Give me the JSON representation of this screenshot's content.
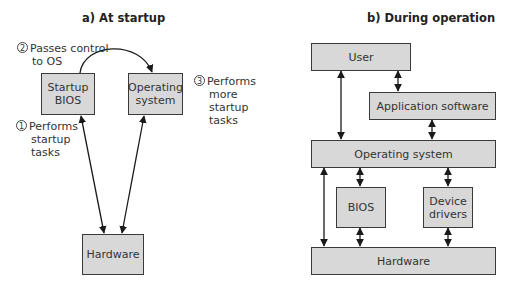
{
  "panel_a": {
    "title": "a) At startup",
    "boxes": {
      "startup_bios": "Startup BIOS",
      "operating_system": "Operating system",
      "hardware": "Hardware"
    },
    "notes": [
      {
        "num": "2",
        "lines": [
          "Passes control",
          "to OS"
        ]
      },
      {
        "num": "3",
        "lines": [
          "Performs",
          "more",
          "startup",
          "tasks"
        ]
      },
      {
        "num": "1",
        "lines": [
          "Performs",
          "startup",
          "tasks"
        ]
      }
    ]
  },
  "panel_b": {
    "title": "b) During operation",
    "boxes": {
      "user": "User",
      "application_software": "Application software",
      "operating_system": "Operating system",
      "bios": "BIOS",
      "device_drivers": "Device drivers",
      "hardware": "Hardware"
    }
  },
  "colors": {
    "box_fill": "#d8d8d8",
    "box_border": "#3a3a3a",
    "arrow": "#1a1a1a"
  }
}
